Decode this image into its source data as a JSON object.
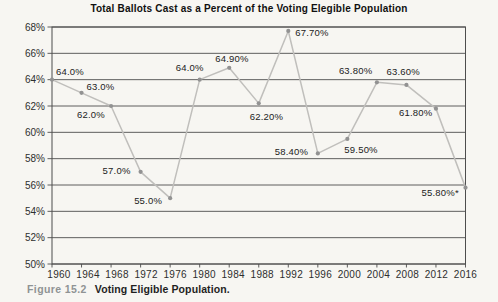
{
  "title": "Total Ballots Cast as a Percent of the Voting Elegible Population",
  "caption": {
    "figure_label": "Figure 15.2",
    "text": "Voting Eligible Population."
  },
  "colors": {
    "background": "#f7f6f2",
    "grid": "#4d4d4d",
    "line": "#c0bfbc",
    "marker": "#929292",
    "data_label": "#222222",
    "axis_label": "#2e2e2e",
    "title": "#101010",
    "caption_label": "#8f9394",
    "caption_text": "#1f1f1f"
  },
  "chart_data": {
    "type": "line",
    "title": "Total Ballots Cast as a Percent of the Voting Elegible Population",
    "x": [
      "1960",
      "1964",
      "1968",
      "1972",
      "1976",
      "1980",
      "1984",
      "1988",
      "1992",
      "1996",
      "2000",
      "2004",
      "2008",
      "2012",
      "2016"
    ],
    "values": [
      64.0,
      63.0,
      62.0,
      57.0,
      55.0,
      64.0,
      64.9,
      62.2,
      67.7,
      58.4,
      59.5,
      63.8,
      63.6,
      61.8,
      55.8
    ],
    "point_labels": [
      "64.0%",
      "63.0%",
      "62.0%",
      "57.0%",
      "55.0%",
      "64.90%",
      "64.90%",
      "62.20%",
      "67.70%",
      "58.40%",
      "59.50%",
      "63.80%",
      "63.60%",
      "61.80%",
      "55.80%*"
    ],
    "xlabel": "",
    "ylabel": "",
    "ylim": [
      50,
      68
    ],
    "ytick_step": 2,
    "ytick_suffix": "%",
    "grid": true,
    "legend": "none",
    "label_offsets": [
      [
        4,
        -5
      ],
      [
        5,
        -3
      ],
      [
        -34,
        12
      ],
      [
        -38,
        2
      ],
      [
        -36,
        6
      ],
      [
        -24,
        -9
      ],
      [
        -14,
        -6
      ],
      [
        -9,
        17
      ],
      [
        7,
        5
      ],
      [
        -43,
        2
      ],
      [
        -3,
        14
      ],
      [
        -38,
        -8
      ],
      [
        -20,
        -10
      ],
      [
        -37,
        7
      ],
      [
        -44,
        8
      ]
    ]
  }
}
